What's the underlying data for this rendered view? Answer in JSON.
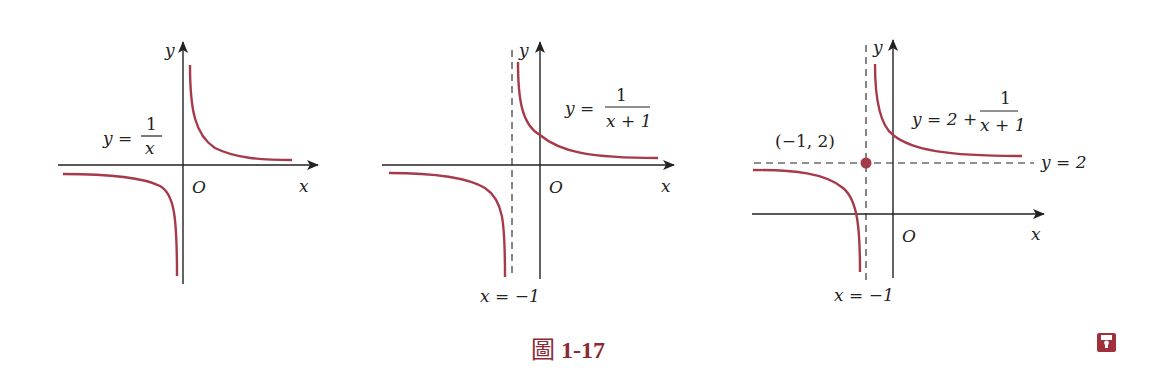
{
  "figure": {
    "caption_char": "圖",
    "caption_number": "1-17",
    "curve_color": "#a63a4a",
    "axis_color": "#222222"
  },
  "graphs": [
    {
      "equation_lhs": "y =",
      "numerator": "1",
      "denominator": "x",
      "axis_x": "x",
      "axis_y": "y",
      "origin": "O"
    },
    {
      "equation_lhs": "y =",
      "numerator": "1",
      "denominator": "x + 1",
      "axis_x": "x",
      "axis_y": "y",
      "origin": "O",
      "vertical_asymptote": "x = −1"
    },
    {
      "equation_lhs": "y = 2 +",
      "numerator": "1",
      "denominator": "x + 1",
      "axis_x": "x",
      "axis_y": "y",
      "origin": "O",
      "vertical_asymptote": "x = −1",
      "horizontal_asymptote": "y = 2",
      "center_point": "(−1, 2)"
    }
  ],
  "icons": {
    "save": "save-icon"
  }
}
